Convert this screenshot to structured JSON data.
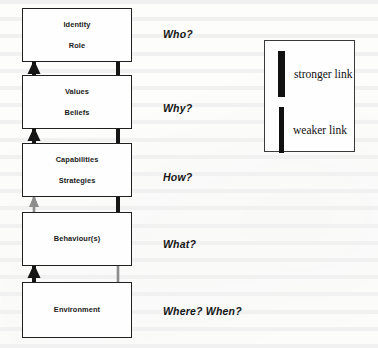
{
  "diagram": {
    "levels": [
      {
        "id": "identity",
        "lines": [
          "Identity",
          "Role"
        ],
        "question": "Who?",
        "box": {
          "x": 22,
          "y": 8,
          "w": 110,
          "h": 54
        },
        "question_pos": {
          "x": 163,
          "y": 28
        }
      },
      {
        "id": "values",
        "lines": [
          "Values",
          "Beliefs"
        ],
        "question": "Why?",
        "box": {
          "x": 22,
          "y": 75,
          "w": 110,
          "h": 54
        },
        "question_pos": {
          "x": 163,
          "y": 102
        }
      },
      {
        "id": "capabilities",
        "lines": [
          "Capabilities",
          "Strategies"
        ],
        "question": "How?",
        "box": {
          "x": 22,
          "y": 143,
          "w": 110,
          "h": 54
        },
        "question_pos": {
          "x": 163,
          "y": 171
        }
      },
      {
        "id": "behaviours",
        "lines": [
          "Behaviour(s)"
        ],
        "question": "What?",
        "box": {
          "x": 22,
          "y": 212,
          "w": 110,
          "h": 54
        },
        "question_pos": {
          "x": 163,
          "y": 238
        }
      },
      {
        "id": "environment",
        "lines": [
          "Environment"
        ],
        "question": "Where? When?",
        "box": {
          "x": 22,
          "y": 282,
          "w": 110,
          "h": 56
        },
        "question_pos": {
          "x": 163,
          "y": 305
        }
      }
    ],
    "connectors": [
      {
        "id": "values-to-identity",
        "direction": "up",
        "strength": "stronger"
      },
      {
        "id": "identity-to-values",
        "direction": "down",
        "strength": "stronger"
      },
      {
        "id": "capabilities-to-values",
        "direction": "up",
        "strength": "stronger"
      },
      {
        "id": "values-to-capabilities",
        "direction": "down",
        "strength": "stronger"
      },
      {
        "id": "behaviours-to-capabilities",
        "direction": "up",
        "strength": "weaker"
      },
      {
        "id": "capabilities-to-behaviours",
        "direction": "down",
        "strength": "stronger"
      },
      {
        "id": "environment-to-behaviours",
        "direction": "up",
        "strength": "stronger"
      },
      {
        "id": "behaviours-to-environment",
        "direction": "down",
        "strength": "weaker"
      }
    ]
  },
  "legend": {
    "box": {
      "x": 264,
      "y": 40,
      "w": 91,
      "h": 112
    },
    "items": [
      {
        "id": "stronger",
        "label": "stronger link",
        "bar": {
          "x": 13,
          "y": 10,
          "w": 7,
          "h": 46
        },
        "color": "#111111"
      },
      {
        "id": "weaker",
        "label": "weaker link",
        "bar": {
          "x": 14,
          "y": 66,
          "w": 5,
          "h": 46
        },
        "color": "#111111"
      }
    ]
  },
  "colors": {
    "ink": "#1a1a1a",
    "box_border": "#202020",
    "arrow_strong": "#151515",
    "arrow_weak": "#8d8d8d",
    "page": "#fdfdfc"
  }
}
